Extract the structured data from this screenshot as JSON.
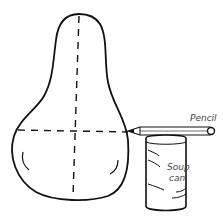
{
  "diagram": {
    "labels": {
      "pencil": "Pencil",
      "soup_line1": "Soup",
      "soup_line2": "can"
    },
    "colors": {
      "ink": "#111111",
      "label": "#444444",
      "background": "#ffffff"
    }
  }
}
